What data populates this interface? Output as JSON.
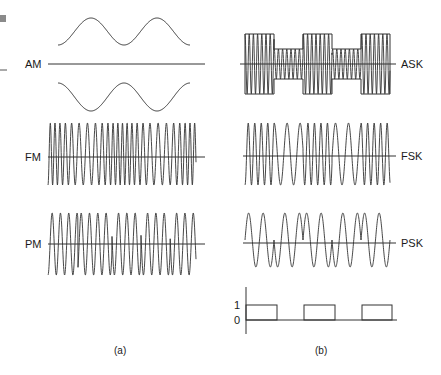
{
  "panels": {
    "a": {
      "caption": "(a)",
      "signals": [
        {
          "id": "am",
          "label": "AM",
          "description": "amplitude modulation envelope"
        },
        {
          "id": "fm",
          "label": "FM",
          "description": "frequency modulated carrier"
        },
        {
          "id": "pm",
          "label": "PM",
          "description": "phase modulated carrier"
        }
      ]
    },
    "b": {
      "caption": "(b)",
      "signals": [
        {
          "id": "ask",
          "label": "ASK",
          "description": "amplitude shift keying"
        },
        {
          "id": "fsk",
          "label": "FSK",
          "description": "frequency shift keying"
        },
        {
          "id": "psk",
          "label": "PSK",
          "description": "phase shift keying"
        }
      ],
      "bit_stream": {
        "y_labels": [
          "1",
          "0"
        ],
        "bits": [
          1,
          0,
          1,
          0,
          1
        ]
      }
    }
  },
  "colors": {
    "stroke": "#333333",
    "background": "#ffffff",
    "corner_mark": "#8a8a8a"
  }
}
